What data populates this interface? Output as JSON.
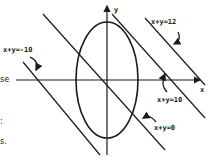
{
  "figure": {
    "axes": {
      "x_label": "x",
      "y_label": "y"
    },
    "curve": {
      "name": "ellipse",
      "center": [
        107,
        80
      ],
      "rx": 31,
      "ry": 58
    },
    "lines": [
      {
        "label": "x+y=12",
        "x1": 145,
        "y1": 18,
        "x2": 205,
        "y2": 85
      },
      {
        "label": "x+y=10",
        "x1": 112,
        "y1": 14,
        "x2": 205,
        "y2": 118
      },
      {
        "label": "x+y=0",
        "x1": 43,
        "y1": 14,
        "x2": 165,
        "y2": 150
      },
      {
        "label": "x+y=-10",
        "x1": 23,
        "y1": 62,
        "x2": 100,
        "y2": 155
      }
    ],
    "stroke_color": "#1a1a1a"
  },
  "left_text_fragments": [
    "se",
    ":",
    "s."
  ]
}
